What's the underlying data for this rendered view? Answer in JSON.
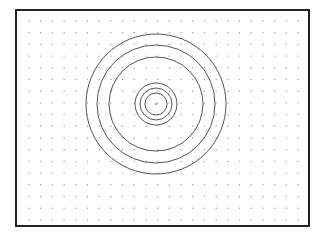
{
  "diagram": {
    "frame": {
      "x": 16,
      "y": 10,
      "width": 293,
      "height": 216,
      "stroke": "#222222",
      "stroke_width": 2
    },
    "grid": {
      "x0": 29,
      "y0": 21,
      "dx": 11.7,
      "dy": 11.7,
      "cols": 24,
      "rows": 18,
      "dot_color": "#999999",
      "dot_radius": 0.7
    },
    "center": {
      "x": 156,
      "y": 104
    },
    "circles": [
      {
        "r": 70
      },
      {
        "r": 59
      },
      {
        "r": 47
      },
      {
        "r": 21
      },
      {
        "r": 16
      },
      {
        "r": 11
      }
    ],
    "circle_stroke": "#555555",
    "center_dot": true
  }
}
